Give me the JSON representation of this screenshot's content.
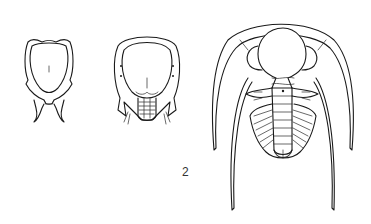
{
  "figure": {
    "specimens": [
      {
        "name": "stage-1-cephalon",
        "description": "early cephalon with genal spines"
      },
      {
        "name": "stage-2-protaspis",
        "description": "cephalon with small segmented trunk"
      },
      {
        "name": "stage-3-adult",
        "description": "adult trilobite with long genal spines"
      }
    ],
    "label": "2"
  }
}
